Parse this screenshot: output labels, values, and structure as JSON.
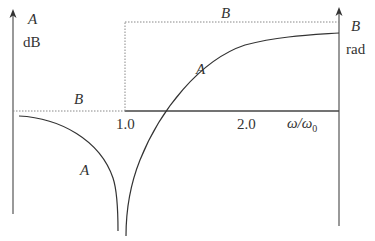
{
  "diagram": {
    "left_axis": {
      "label": "A",
      "unit": "dB"
    },
    "right_axis": {
      "label": "B",
      "unit": "rad"
    },
    "x_axis": {
      "label": "ω/ω",
      "subscript": "0",
      "ticks": [
        "1.0",
        "2.0"
      ]
    },
    "curve_labels": {
      "b_left": "B",
      "b_top": "B",
      "a_upper": "A",
      "a_lower": "A"
    }
  }
}
